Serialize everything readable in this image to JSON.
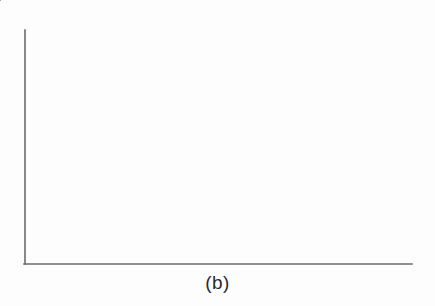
{
  "figure": {
    "caption": "(b)",
    "background_color": "#fdfdfd",
    "axis_color": "#6b6b6b",
    "series_color": "#111111",
    "marker_color": "#111111"
  },
  "axes": {
    "left_axis": {
      "x": 25,
      "y_top": 30,
      "y_bottom": 264
    },
    "bottom_axis": {
      "y": 264,
      "x_left": 24,
      "x_right": 412
    },
    "divider": {
      "x": 207,
      "y_top": 30,
      "y_bottom": 264
    },
    "line_width": 1.6
  },
  "chart_data": {
    "type": "line",
    "title": "",
    "subtitle": "",
    "xlabel": "",
    "ylabel": "",
    "grid": false,
    "legend": "none",
    "axis_ticks": {
      "x": [],
      "y": []
    },
    "xlim": [
      24,
      412
    ],
    "ylim": [
      264,
      30
    ],
    "annotations": [
      "(b)"
    ],
    "series": [
      {
        "name": "left-panel-high-amplitude-oscillation",
        "marker": "filled-circle",
        "marker_size": 7,
        "line_width": 2.6,
        "points": [
          [
            32,
            170
          ],
          [
            44,
            94
          ],
          [
            55,
            215
          ],
          [
            67,
            78
          ],
          [
            77,
            202
          ],
          [
            86,
            129
          ],
          [
            98,
            179
          ],
          [
            112,
            79
          ],
          [
            121,
            209
          ],
          [
            131,
            144
          ],
          [
            142,
            181
          ],
          [
            155,
            94
          ],
          [
            168,
            196
          ],
          [
            181,
            120
          ],
          [
            192,
            153
          ]
        ]
      },
      {
        "name": "right-panel-low-amplitude-oscillation",
        "marker": "filled-circle",
        "marker_size": 7,
        "line_width": 2.6,
        "points": [
          [
            212,
            149
          ],
          [
            229,
            168
          ],
          [
            244,
            149
          ],
          [
            259,
            168
          ],
          [
            274,
            149
          ],
          [
            289,
            168
          ],
          [
            305,
            149
          ],
          [
            320,
            168
          ],
          [
            336,
            149
          ],
          [
            351,
            168
          ],
          [
            366,
            149
          ],
          [
            382,
            168
          ],
          [
            397,
            150
          ]
        ]
      }
    ]
  }
}
